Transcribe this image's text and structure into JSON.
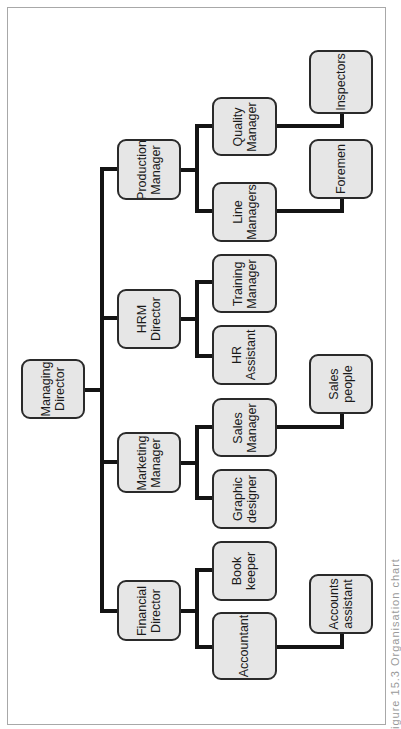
{
  "diagram": {
    "type": "organisation-chart",
    "orientation": "rotated-90-ccw",
    "caption": "igure 15.3  Organisation chart",
    "colors": {
      "box_fill": "#e6e6e6",
      "box_border": "#2a2a2a",
      "connector": "#141414"
    },
    "root": {
      "id": "md",
      "label": "Managing\nDirector"
    },
    "level1": [
      {
        "id": "prod",
        "label": "Production\nManager"
      },
      {
        "id": "hrm",
        "label": "HRM\nDirector"
      },
      {
        "id": "mkt",
        "label": "Marketing\nManager"
      },
      {
        "id": "fin",
        "label": "Financial\nDirector"
      }
    ],
    "level2": [
      {
        "id": "qm",
        "parent": "prod",
        "label": "Quality\nManager"
      },
      {
        "id": "lm",
        "parent": "prod",
        "label": "Line\nManagers"
      },
      {
        "id": "tm",
        "parent": "hrm",
        "label": "Training\nManager"
      },
      {
        "id": "hra",
        "parent": "hrm",
        "label": "HR\nAssistant"
      },
      {
        "id": "sm",
        "parent": "mkt",
        "label": "Sales\nManager"
      },
      {
        "id": "gd",
        "parent": "mkt",
        "label": "Graphic\ndesigner"
      },
      {
        "id": "bk",
        "parent": "fin",
        "label": "Book\nkeeper"
      },
      {
        "id": "acc",
        "parent": "fin",
        "label": "Accountant"
      }
    ],
    "level3": [
      {
        "id": "insp",
        "parent": "qm",
        "label": "Inspectors"
      },
      {
        "id": "fore",
        "parent": "lm",
        "label": "Foremen"
      },
      {
        "id": "sp",
        "parent": "sm",
        "label": "Sales\npeople"
      },
      {
        "id": "aa",
        "parent": "acc",
        "label": "Accounts\nassistant"
      }
    ]
  }
}
